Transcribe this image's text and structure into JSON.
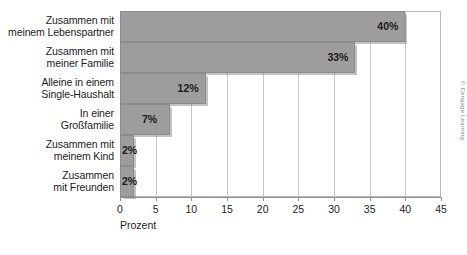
{
  "chart_data": {
    "type": "bar",
    "orientation": "horizontal",
    "title": "",
    "xlabel": "Prozent",
    "ylabel": "",
    "xlim": [
      0,
      45
    ],
    "xticks": [
      0,
      5,
      10,
      15,
      20,
      25,
      30,
      35,
      40,
      45
    ],
    "xtick_labels": [
      "0",
      "5",
      "10",
      "15",
      "20",
      "25",
      "30",
      "35",
      "40",
      "45"
    ],
    "grid": true,
    "legend": false,
    "categories": [
      "Zusammen mit meinem Lebenspartner",
      "Zusammen mit meiner Familie",
      "Alleine in einem Single-Haushalt",
      "In einer Großfamilie",
      "Zusammen mit meinem Kind",
      "Zusammen mit Freunden"
    ],
    "category_lines": [
      [
        "Zusammen mit",
        "meinem Lebenspartner"
      ],
      [
        "Zusammen mit",
        "meiner Familie"
      ],
      [
        "Alleine in einem",
        "Single-Haushalt"
      ],
      [
        "In einer",
        "Großfamilie"
      ],
      [
        "Zusammen mit",
        "meinem Kind"
      ],
      [
        "Zusammen",
        "mit Freunden"
      ]
    ],
    "values": [
      40,
      33,
      12,
      7,
      2,
      2
    ],
    "data_labels": [
      "40%",
      "33%",
      "12%",
      "7%",
      "2%",
      "2%"
    ],
    "bar_color": "#9d9d9d",
    "bar_border_color": "#8c8c8c",
    "grid_color": "#c9c9c9",
    "text_color": "#1b1b1b"
  },
  "credit": {
    "text": "© Cengage Learning"
  }
}
